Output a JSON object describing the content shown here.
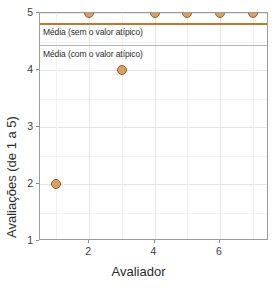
{
  "chart_data": {
    "type": "scatter",
    "title": "",
    "xlabel": "Avaliador",
    "ylabel": "Avaliações (de 1 a 5)",
    "xlim": [
      0.5,
      7.5
    ],
    "ylim": [
      1,
      5
    ],
    "grid": true,
    "legend": "none",
    "x": [
      1,
      2,
      3,
      4,
      5,
      6,
      7
    ],
    "values": [
      2,
      5,
      4,
      5,
      5,
      5,
      5
    ],
    "series": [
      {
        "name": "Avaliações",
        "x": [
          1,
          2,
          3,
          4,
          5,
          6,
          7
        ],
        "values": [
          2,
          5,
          4,
          5,
          5,
          5,
          5
        ],
        "marker_fill": "#d9a066",
        "marker_stroke": "#9a5f23"
      }
    ],
    "xticks": [
      2,
      4,
      6
    ],
    "xticklabels": [
      "2",
      "4",
      "6"
    ],
    "yticks": [
      1,
      2,
      3,
      4,
      5
    ],
    "yticklabels": [
      "1",
      "2",
      "3",
      "4",
      "5"
    ],
    "reference_lines": [
      {
        "id": "without-outlier",
        "label": "Média (sem o valor atípico)",
        "value": 4.83,
        "color": "#c1762c"
      },
      {
        "id": "with-outlier",
        "label": "Média (com o valor atípico)",
        "value": 4.43,
        "color": "#b0b3b8"
      }
    ]
  },
  "axes": {
    "x_title": "Avaliador",
    "y_title": "Avaliações (de 1 a 5)",
    "x_tick_labels": [
      "2",
      "4",
      "6"
    ],
    "y_tick_labels": [
      "1",
      "2",
      "3",
      "4",
      "5"
    ]
  },
  "annotations": {
    "without_outlier": "Média (sem o valor atípico)",
    "with_outlier": "Média (com o valor atípico)"
  }
}
